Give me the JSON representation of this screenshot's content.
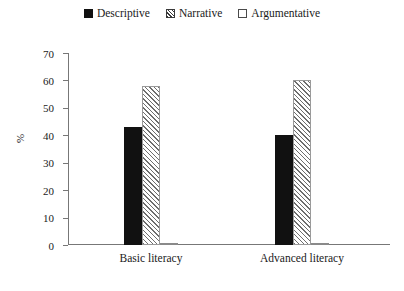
{
  "chart_data": {
    "type": "bar",
    "title": "",
    "xlabel": "",
    "ylabel": "%",
    "ylim": [
      0,
      70
    ],
    "yticks": [
      0,
      10,
      20,
      30,
      40,
      50,
      60,
      70
    ],
    "grid": false,
    "legend_position": "top-center",
    "categories": [
      "Basic literacy",
      "Advanced literacy"
    ],
    "series": [
      {
        "name": "Descriptive",
        "values": [
          43,
          40
        ]
      },
      {
        "name": "Narrative",
        "values": [
          58,
          60
        ]
      },
      {
        "name": "Argumentative",
        "values": [
          0,
          0.5
        ]
      }
    ]
  },
  "legend": {
    "items": [
      {
        "label": "Descriptive",
        "swatch": "solid-black-square-icon"
      },
      {
        "label": "Narrative",
        "swatch": "hatched-square-icon"
      },
      {
        "label": "Argumentative",
        "swatch": "empty-square-icon"
      }
    ]
  },
  "axes": {
    "y_title": "%",
    "y_tick_labels": [
      "70",
      "60",
      "50",
      "40",
      "30",
      "20",
      "10",
      "0"
    ],
    "x_tick_labels": [
      "Basic literacy",
      "Advanced literacy"
    ]
  },
  "colors": {
    "descriptive": "#111111",
    "narrative_hatch": "#6e6e6e",
    "argumentative": "#ffffff",
    "axis": "#777777",
    "text": "#1a1a1a",
    "background": "#ffffff"
  }
}
